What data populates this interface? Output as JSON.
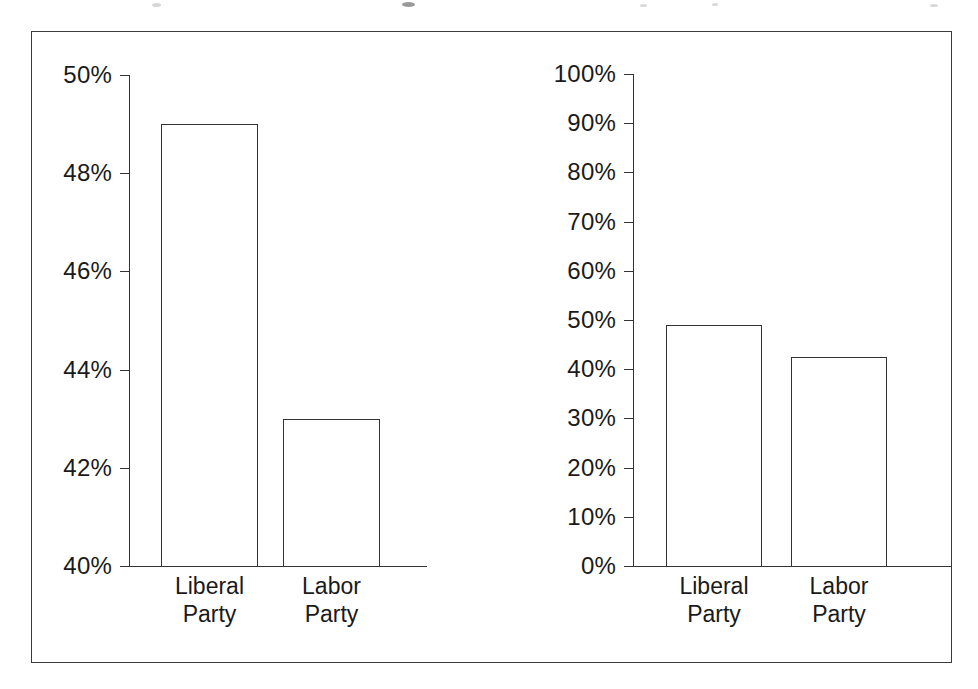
{
  "figure": {
    "frame_color": "#3a3a3a",
    "line_color": "#333333",
    "background": "#ffffff"
  },
  "chart_data": [
    {
      "id": "left",
      "type": "bar",
      "title": "",
      "xlabel": "",
      "ylabel": "",
      "categories": [
        "Liberal Party",
        "Labor Party"
      ],
      "category_lines": [
        [
          "Liberal",
          "Party"
        ],
        [
          "Labor",
          "Party"
        ]
      ],
      "values": [
        49,
        43
      ],
      "ylim": [
        40,
        50
      ],
      "ytick_values": [
        50,
        48,
        46,
        44,
        42,
        40
      ],
      "ytick_labels": [
        "50%",
        "48%",
        "46%",
        "44%",
        "42%",
        "40%"
      ],
      "grid": false,
      "legend": "none",
      "note": "truncated y-axis starting at 40% exaggerates the gap between parties"
    },
    {
      "id": "right",
      "type": "bar",
      "title": "",
      "xlabel": "",
      "ylabel": "",
      "categories": [
        "Liberal Party",
        "Labor Party"
      ],
      "category_lines": [
        [
          "Liberal",
          "Party"
        ],
        [
          "Labor",
          "Party"
        ]
      ],
      "values": [
        49,
        42.5
      ],
      "ylim": [
        0,
        100
      ],
      "ytick_values": [
        100,
        90,
        80,
        70,
        60,
        50,
        40,
        30,
        20,
        10,
        0
      ],
      "ytick_labels": [
        "100%",
        "90%",
        "80%",
        "70%",
        "60%",
        "50%",
        "40%",
        "30%",
        "20%",
        "10%",
        "0%"
      ],
      "grid": false,
      "legend": "none",
      "note": "full 0-100% y-axis shows the two parties are nearly level"
    }
  ]
}
